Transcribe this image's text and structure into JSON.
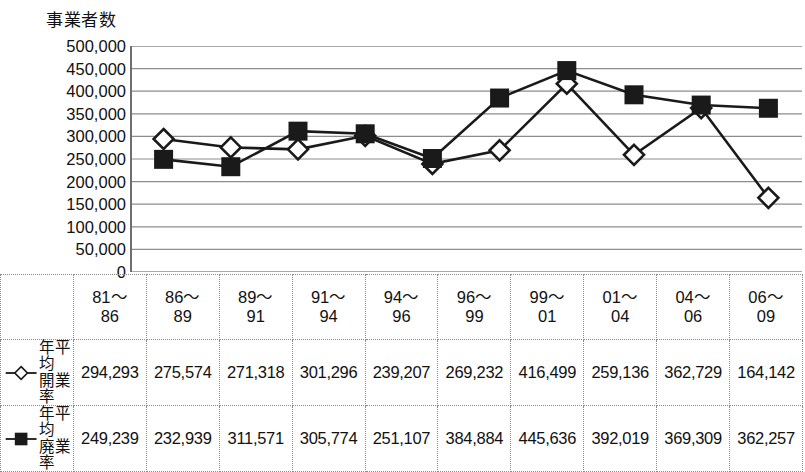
{
  "chart": {
    "y_axis_title": "事業者数",
    "y_ticks": [
      "500,000",
      "450,000",
      "400,000",
      "350,000",
      "300,000",
      "250,000",
      "200,000",
      "150,000",
      "100,000",
      "50,000",
      "0"
    ]
  },
  "legend": {
    "series1_marker": "open-diamond",
    "series2_marker": "filled-square",
    "series1_label": "年平均\n開業率",
    "series2_label": "年平均\n廃業率"
  },
  "table": {
    "periods": [
      "81～\n86",
      "86～\n89",
      "89～\n91",
      "91～\n94",
      "94～\n96",
      "96～\n99",
      "99～\n01",
      "01～\n04",
      "04～\n06",
      "06～\n09"
    ],
    "row_opening": [
      "294,293",
      "275,574",
      "271,318",
      "301,296",
      "239,207",
      "269,232",
      "416,499",
      "259,136",
      "362,729",
      "164,142"
    ],
    "row_closing": [
      "249,239",
      "232,939",
      "311,571",
      "305,774",
      "251,107",
      "384,884",
      "445,636",
      "392,019",
      "369,309",
      "362,257"
    ]
  },
  "chart_data": {
    "type": "line",
    "title": "事業者数",
    "xlabel": "",
    "ylabel": "事業者数",
    "ylim": [
      0,
      500000
    ],
    "ytick_step": 50000,
    "grid": true,
    "legend_position": "table-left",
    "categories": [
      "81～86",
      "86～89",
      "89～91",
      "91～94",
      "94～96",
      "96～99",
      "99～01",
      "01～04",
      "04～06",
      "06～09"
    ],
    "series": [
      {
        "name": "年平均開業率",
        "marker": "open-diamond",
        "values": [
          294293,
          275574,
          271318,
          301296,
          239207,
          269232,
          416499,
          259136,
          362729,
          164142
        ]
      },
      {
        "name": "年平均廃業率",
        "marker": "filled-square",
        "values": [
          249239,
          232939,
          311571,
          305774,
          251107,
          384884,
          445636,
          392019,
          369309,
          362257
        ]
      }
    ]
  },
  "colors": {
    "line": "#1a1a1a",
    "grid": "#8d8d8d",
    "axis": "#6f6f6f",
    "text": "#111111"
  }
}
